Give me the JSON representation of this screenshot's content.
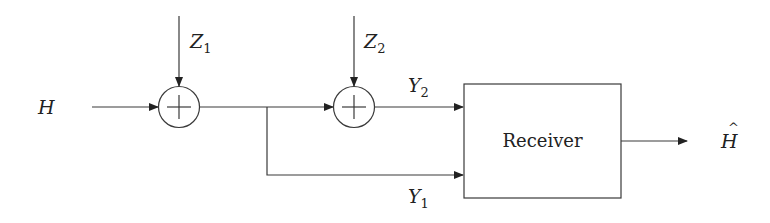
{
  "diagram": {
    "type": "block-diagram",
    "input": {
      "label": "H"
    },
    "noises": [
      {
        "id": "z1",
        "symbol": "Z",
        "subscript": "1"
      },
      {
        "id": "z2",
        "symbol": "Z",
        "subscript": "2"
      }
    ],
    "adders": [
      {
        "id": "adder1",
        "symbol": "+"
      },
      {
        "id": "adder2",
        "symbol": "+"
      }
    ],
    "outputs_to_receiver": [
      {
        "id": "y2",
        "symbol": "Y",
        "subscript": "2"
      },
      {
        "id": "y1",
        "symbol": "Y",
        "subscript": "1"
      }
    ],
    "receiver": {
      "label": "Receiver"
    },
    "estimate": {
      "label": "H",
      "accent": "^"
    },
    "colors": {
      "stroke": "#3a3a3a",
      "text": "#222222",
      "background": "#ffffff"
    }
  }
}
